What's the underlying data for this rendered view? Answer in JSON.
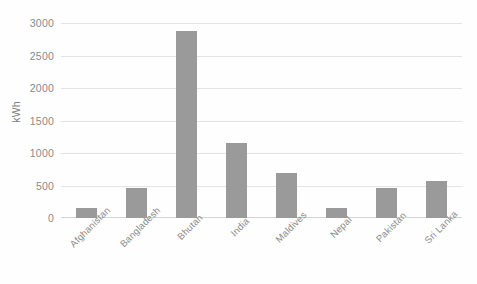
{
  "chart_data": {
    "type": "bar",
    "title": "",
    "subtitle": "",
    "xlabel": "",
    "ylabel": "kWh",
    "ylim": [
      0,
      3000
    ],
    "yticks": [
      0,
      500,
      1000,
      1500,
      2000,
      2500,
      3000
    ],
    "ytick_labels": [
      "0",
      "500",
      "1000",
      "1500",
      "2000",
      "2500",
      "3000"
    ],
    "grid": true,
    "legend": false,
    "legend_position": "none",
    "bar_color": "#9a9a9a",
    "gridline_color": "#e4e4e4",
    "text_color": "#8a8a8a",
    "categories": [
      "Afghanistan",
      "Bangladesh",
      "Bhutan",
      "India",
      "Maldives",
      "Nepal",
      "Pakistan",
      "Sri Lanka"
    ],
    "values": [
      155,
      460,
      2880,
      1160,
      700,
      155,
      460,
      570
    ]
  }
}
